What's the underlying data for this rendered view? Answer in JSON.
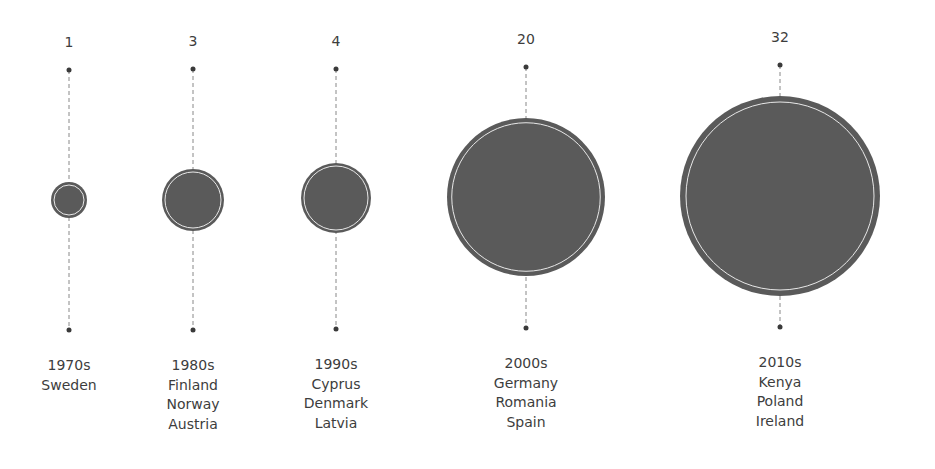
{
  "chart_data": {
    "type": "bubble",
    "title": "",
    "categories": [
      "1970s",
      "1980s",
      "1990s",
      "2000s",
      "2010s"
    ],
    "values": [
      1,
      3,
      4,
      20,
      32
    ],
    "countries": [
      [
        "Sweden"
      ],
      [
        "Finland",
        "Norway",
        "Austria"
      ],
      [
        "Cyprus",
        "Denmark",
        "Latvia"
      ],
      [
        "Germany",
        "Romania",
        "Spain"
      ],
      [
        "Kenya",
        "Poland",
        "Ireland"
      ]
    ],
    "xlabel": "",
    "ylabel": "",
    "grid": false,
    "legend": "none"
  },
  "colors": {
    "bubble_fill": "#5a5a5a",
    "bubble_inner_ring": "#e8e8e8",
    "stem": "#888888",
    "dot": "#3a3a3a",
    "text": "#3d3d3d"
  },
  "columns": [
    {
      "x": 69,
      "cy": 200,
      "r": 18,
      "top": 70,
      "bottom": 330,
      "value": "1",
      "decade": "1970s",
      "countries": [
        "Sweden"
      ]
    },
    {
      "x": 193,
      "cy": 200,
      "r": 31,
      "top": 69,
      "bottom": 330,
      "value": "3",
      "decade": "1980s",
      "countries": [
        "Finland",
        "Norway",
        "Austria"
      ]
    },
    {
      "x": 336,
      "cy": 198,
      "r": 35,
      "top": 69,
      "bottom": 329,
      "value": "4",
      "decade": "1990s",
      "countries": [
        "Cyprus",
        "Denmark",
        "Latvia"
      ]
    },
    {
      "x": 526,
      "cy": 197,
      "r": 79,
      "top": 67,
      "bottom": 328,
      "value": "20",
      "decade": "2000s",
      "countries": [
        "Germany",
        "Romania",
        "Spain"
      ]
    },
    {
      "x": 780,
      "cy": 196,
      "r": 100,
      "top": 65,
      "bottom": 327,
      "value": "32",
      "decade": "2010s",
      "countries": [
        "Kenya",
        "Poland",
        "Ireland"
      ]
    }
  ]
}
